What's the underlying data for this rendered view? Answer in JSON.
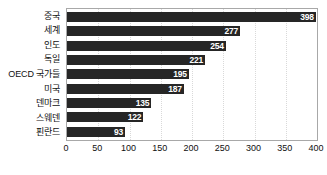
{
  "chart_data": {
    "type": "bar",
    "orientation": "horizontal",
    "title": "",
    "subtitle": "",
    "xlabel": "",
    "ylabel": "",
    "categories": [
      "중국",
      "세계",
      "인도",
      "독일",
      "OECD 국가들",
      "미국",
      "덴마크",
      "스웨덴",
      "핀란드"
    ],
    "values": [
      398,
      277,
      254,
      221,
      195,
      187,
      135,
      122,
      93
    ],
    "value_labels": [
      "398",
      "277",
      "254",
      "221",
      "195",
      "187",
      "135",
      "122",
      "93"
    ],
    "xlim": [
      0,
      400
    ],
    "xticks": [
      0,
      50,
      100,
      150,
      200,
      250,
      300,
      350,
      400
    ],
    "xtick_labels": [
      "0",
      "50",
      "100",
      "150",
      "200",
      "250",
      "300",
      "350",
      "400"
    ],
    "grid": true,
    "grid_axis": "x",
    "legend": false,
    "legend_position": "none",
    "colors": {
      "bar": "#262626",
      "value_label": "#ffffff",
      "gridline": "#d9d9d9",
      "frame": "#a8a8a8",
      "axis_text": "#101010",
      "background": "#ffffff"
    }
  }
}
